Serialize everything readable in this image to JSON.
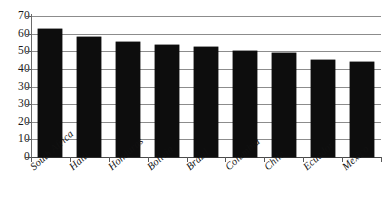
{
  "chart_data": {
    "type": "bar",
    "title": "",
    "subtitle": "",
    "xlabel": "",
    "ylabel": "",
    "ylim": [
      0,
      70
    ],
    "grid": true,
    "legend": null,
    "legend_position": "none",
    "orientation": "vertical",
    "bar_color": "#0d0d0d",
    "categories": [
      "South Africa",
      "Haiti",
      "Honduras",
      "Bolivia",
      "Brazil",
      "Columbia",
      "Chile",
      "Ecuador",
      "Mexico"
    ],
    "values": [
      63.5,
      59.5,
      57.0,
      55.5,
      54.5,
      52.5,
      51.5,
      48.0,
      47.0
    ],
    "ytick_labels": [
      "70",
      "60",
      "50",
      "40",
      "30",
      "30",
      "20",
      "10",
      "0"
    ],
    "ytick_values": [
      70,
      60,
      50,
      40,
      30,
      20,
      10,
      0
    ]
  },
  "style": {
    "axis_color": "#5a5a5a",
    "grid_color": "#8c8c8c",
    "background": "#ffffff",
    "text_color": "#111111"
  }
}
